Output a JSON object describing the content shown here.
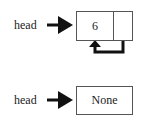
{
  "diagram": {
    "type": "linked-list",
    "lists": [
      {
        "pointer_label": "head",
        "node": {
          "value": "6",
          "next": "self"
        },
        "description": "Circular single-node list: node's next pointer loops back to itself"
      },
      {
        "pointer_label": "head",
        "node": {
          "value": "None"
        },
        "description": "Empty list: head points to None"
      }
    ]
  },
  "colors": {
    "stroke": "#111111",
    "box_border": "#555555",
    "text": "#222222"
  }
}
